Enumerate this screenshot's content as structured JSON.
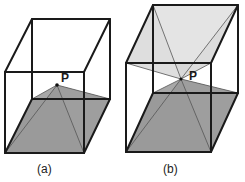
{
  "figures": [
    {
      "id": "a",
      "caption": "(a)",
      "point_label": "P",
      "description": "Cube with pyramid from bottom face to interior point P"
    },
    {
      "id": "b",
      "caption": "(b)",
      "point_label": "P",
      "description": "Cube with two pyramids from top and bottom faces meeting at interior point P"
    }
  ],
  "colors": {
    "edge": "#1a1a1a",
    "dark_shade": "#9a9a9a",
    "light_shade": "#dcdcdc",
    "background": "#ffffff"
  }
}
